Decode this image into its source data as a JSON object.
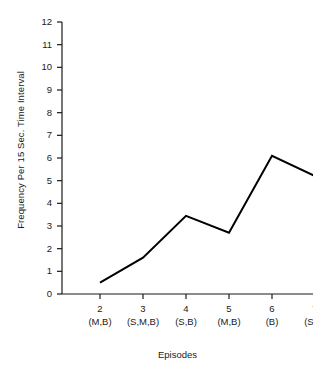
{
  "chart_data": {
    "type": "line",
    "title": "",
    "xlabel": "Episodes",
    "ylabel": "Frequency Per 15 Sec. Time Interval",
    "categories": [
      "2",
      "3",
      "4",
      "5",
      "6",
      "7"
    ],
    "category_codes": [
      "(M,B)",
      "(S,M,B)",
      "(S,B)",
      "(M,B)",
      "(B)",
      "(S,B)"
    ],
    "x": [
      2,
      3,
      4,
      5,
      6,
      7
    ],
    "values": [
      0.5,
      1.6,
      3.45,
      2.7,
      6.1,
      5.2
    ],
    "series": [
      {
        "name": "",
        "values": [
          0.5,
          1.6,
          3.45,
          2.7,
          6.1,
          5.2
        ]
      }
    ],
    "ylim": [
      0,
      12
    ],
    "ytick_labels": [
      "0",
      "1",
      "2",
      "3",
      "4",
      "5",
      "6",
      "7",
      "8",
      "9",
      "10",
      "11",
      "12"
    ],
    "ytick_values": [
      0,
      1,
      2,
      3,
      4,
      5,
      6,
      7,
      8,
      9,
      10,
      11,
      12
    ],
    "grid": false,
    "legend": null,
    "legend_position": "none",
    "line_color": "#000000",
    "axis_color": "#1a1a1a",
    "background_color": "#ffffff",
    "markers": false
  }
}
